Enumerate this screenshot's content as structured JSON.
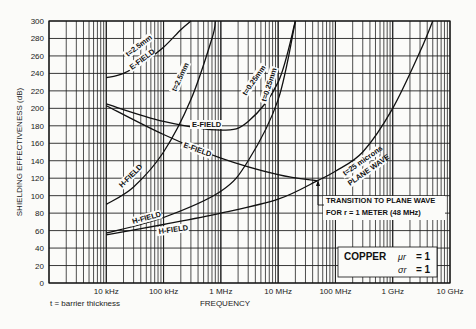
{
  "chart_data": {
    "type": "line",
    "title": "",
    "xlabel": "FREQUENCY",
    "ylabel": "SHIELDING EFFECTIVENESS (dB)",
    "xscale": "log",
    "xlim_hz": [
      1000,
      10000000000
    ],
    "ylim": [
      0,
      300
    ],
    "yticks": [
      0,
      20,
      40,
      60,
      80,
      100,
      120,
      140,
      160,
      180,
      200,
      220,
      240,
      260,
      280,
      300
    ],
    "xtick_labels": [
      "10 kHz",
      "100 kHz",
      "1 MHz",
      "10 MHz",
      "100 MHz",
      "1 GHz",
      "10 GHz"
    ],
    "grid": true,
    "footnote": "t = barrier thickness",
    "material_box": {
      "line1": "COPPER: μr = 1",
      "line2": "σr = 1",
      "material": "COPPER",
      "mu": "μr",
      "mu_value": "= 1",
      "sigma": "σr",
      "sigma_value": "= 1"
    },
    "annotation": {
      "line1": "TRANSITION TO PLANE WAVE",
      "line2": "FOR r = 1 METER (48 MHz)"
    },
    "series": [
      {
        "name": "E-FIELD t=2.5mm",
        "label_field": "E-FIELD",
        "label_thick": "t=2.5mm",
        "points": [
          [
            10000,
            235
          ],
          [
            20000,
            240
          ],
          [
            50000,
            255
          ],
          [
            100000,
            270
          ],
          [
            200000,
            290
          ],
          [
            300000,
            300
          ]
        ]
      },
      {
        "name": "H-FIELD t=2.5mm",
        "label_field": "H-FIELD",
        "label_thick": "t=2.5mm",
        "points": [
          [
            10000,
            90
          ],
          [
            30000,
            110
          ],
          [
            100000,
            150
          ],
          [
            300000,
            210
          ],
          [
            700000,
            280
          ],
          [
            800000,
            300
          ]
        ]
      },
      {
        "name": "E-FIELD t=0.25mm",
        "label_field": "E-FIELD",
        "label_thick": "t=0.25mm",
        "points": [
          [
            10000,
            205
          ],
          [
            100000,
            185
          ],
          [
            1000000,
            175
          ],
          [
            3000000,
            185
          ],
          [
            10000000,
            230
          ],
          [
            20000000,
            300
          ]
        ]
      },
      {
        "name": "H-FIELD t=0.25mm",
        "label_field": "H-FIELD",
        "label_thick": "t=0.25mm",
        "points": [
          [
            10000,
            57
          ],
          [
            100000,
            75
          ],
          [
            1000000,
            105
          ],
          [
            3000000,
            140
          ],
          [
            10000000,
            210
          ],
          [
            20000000,
            300
          ]
        ]
      },
      {
        "name": "E-FIELD t=25 microns",
        "label_field": "E-FIELD",
        "points": [
          [
            10000,
            203
          ],
          [
            100000,
            170
          ],
          [
            1000000,
            143
          ],
          [
            10000000,
            124
          ],
          [
            48000000,
            117
          ]
        ]
      },
      {
        "name": "H-FIELD t=25 microns",
        "label_field": "H-FIELD",
        "points": [
          [
            10000,
            55
          ],
          [
            100000,
            67
          ],
          [
            1000000,
            80
          ],
          [
            10000000,
            96
          ],
          [
            48000000,
            117
          ]
        ]
      },
      {
        "name": "PLANE WAVE t=25 microns",
        "label_field": "PLANE WAVE",
        "label_thick": "t=25 microns",
        "points": [
          [
            48000000,
            117
          ],
          [
            100000000,
            128
          ],
          [
            300000000,
            150
          ],
          [
            1000000000,
            200
          ],
          [
            3000000000,
            265
          ],
          [
            5000000000,
            300
          ]
        ]
      }
    ]
  }
}
